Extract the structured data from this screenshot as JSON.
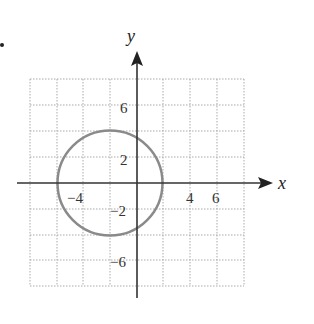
{
  "figure": {
    "bullet": "•",
    "x_axis_label": "x",
    "y_axis_label": "y",
    "x_tick_labels": [
      {
        "value": -4,
        "text": "−4"
      },
      {
        "value": 4,
        "text": "4"
      },
      {
        "value": 6,
        "text": "6"
      }
    ],
    "y_tick_labels": [
      {
        "value": 6,
        "text": "6"
      },
      {
        "value": 2,
        "text": "2"
      },
      {
        "value": -2,
        "text": "−2"
      },
      {
        "value": -6,
        "text": "−6"
      }
    ],
    "grid": {
      "x_range": [
        -8,
        8
      ],
      "y_range": [
        -8,
        8
      ],
      "step": 2,
      "style": "dotted"
    },
    "circle": {
      "center": [
        -2,
        0
      ],
      "radius": 4,
      "color": "#888888"
    },
    "colors": {
      "axis": "#333333",
      "grid": "#aaaaaa",
      "curve": "#888888"
    }
  }
}
